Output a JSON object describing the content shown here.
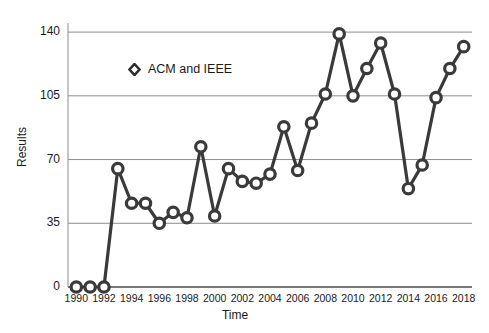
{
  "chart_data": {
    "type": "line",
    "title": "",
    "xlabel": "Time",
    "ylabel": "Results",
    "xlim": [
      1989.4,
      2018.6
    ],
    "ylim": [
      0,
      145
    ],
    "yticks": [
      0,
      35,
      70,
      105,
      140
    ],
    "xticks": [
      1990,
      1992,
      1994,
      1996,
      1998,
      2000,
      2002,
      2004,
      2006,
      2008,
      2010,
      2012,
      2014,
      2016,
      2018
    ],
    "grid": true,
    "legend_position": "upper-left-inside",
    "marker": "circle-open",
    "line_color": "#3a3a3a",
    "series": [
      {
        "name": "ACM and IEEE",
        "x": [
          1990,
          1991,
          1992,
          1993,
          1994,
          1995,
          1996,
          1997,
          1998,
          1999,
          2000,
          2001,
          2002,
          2003,
          2004,
          2005,
          2006,
          2007,
          2008,
          2009,
          2010,
          2011,
          2012,
          2013,
          2014,
          2015,
          2016,
          2017,
          2018
        ],
        "values": [
          0,
          0,
          0,
          65,
          46,
          46,
          35,
          41,
          38,
          77,
          39,
          65,
          58,
          57,
          62,
          88,
          64,
          90,
          106,
          139,
          105,
          120,
          134,
          106,
          54,
          67,
          104,
          120,
          132
        ]
      }
    ]
  },
  "legend": {
    "entries": [
      {
        "label": "ACM and IEEE",
        "marker": "diamond-open-icon"
      }
    ]
  },
  "axes": {
    "y_title": "Results",
    "x_title": "Time"
  }
}
